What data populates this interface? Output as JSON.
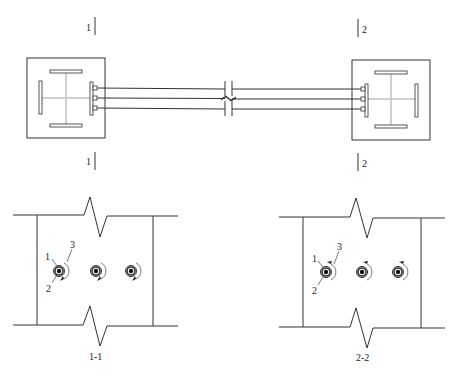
{
  "diagram": {
    "type": "structural-connection-detail",
    "plan_view": {
      "section_marks": [
        {
          "id": "1",
          "label": "1",
          "position": "top-left"
        },
        {
          "id": "1b",
          "label": "1",
          "position": "bottom-left"
        },
        {
          "id": "2",
          "label": "2",
          "position": "top-right"
        },
        {
          "id": "2b",
          "label": "2",
          "position": "bottom-right"
        }
      ],
      "columns": [
        {
          "name": "left-column",
          "shape": "cruciform-steel-section-in-square"
        },
        {
          "name": "right-column",
          "shape": "cruciform-steel-section-in-square"
        }
      ],
      "connecting_members": 3,
      "break_symbol": true
    },
    "sections": [
      {
        "title": "1-1",
        "callouts": [
          {
            "number": "1"
          },
          {
            "number": "3"
          },
          {
            "number": "2"
          }
        ],
        "bolts": 3,
        "rotation_arrow": "clockwise-bottom"
      },
      {
        "title": "2-2",
        "callouts": [
          {
            "number": "1"
          },
          {
            "number": "3"
          },
          {
            "number": "2"
          }
        ],
        "bolts": 3,
        "rotation_arrow": "counterclockwise-top"
      }
    ]
  },
  "colors": {
    "line": "#333333",
    "background": "#ffffff"
  }
}
